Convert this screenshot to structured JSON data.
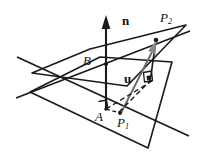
{
  "figure": {
    "background_color": "#ffffff",
    "stroke_color": "#1a1a1a",
    "labels": {
      "normal_vector": "n",
      "point_upper": "P",
      "point_upper_sub": "2",
      "point_on_plane_b": "B",
      "vector_u": "u",
      "point_foot_a": "A",
      "point_lower": "P",
      "point_lower_sub": "1"
    },
    "elements": {
      "plane_lower_name": "lower-plane",
      "plane_upper_name": "upper-plane",
      "normal_arrow_name": "normal-vector-arrow",
      "u_arrow_name": "u-vector-arrow",
      "dashed_name": "projection-dashed-lines",
      "right_angle_a_name": "right-angle-marker-at-a",
      "right_angle_p2_name": "right-angle-marker-at-p2"
    },
    "geometry": {
      "point_A": [
        105,
        108
      ],
      "point_B": [
        101,
        64
      ],
      "point_P1": [
        120,
        113
      ],
      "point_P2": [
        156,
        40
      ],
      "normal_tip": [
        100,
        18
      ],
      "normal_base": [
        106,
        110
      ]
    }
  }
}
